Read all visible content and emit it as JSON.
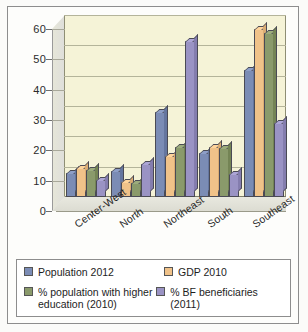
{
  "chart_data": {
    "type": "bar",
    "title": "",
    "xlabel": "",
    "ylabel": "",
    "ylim": [
      0,
      60
    ],
    "yticks": [
      "0",
      "10",
      "20",
      "30",
      "40",
      "50",
      "60"
    ],
    "grid": true,
    "legend_position": "bottom",
    "categories": [
      "Center-West",
      "North",
      "Northeast",
      "South",
      "Southeast"
    ],
    "series": [
      {
        "name": "Population 2012",
        "color": "#7b8cb5",
        "values": [
          8,
          8.5,
          28,
          14.5,
          42
        ]
      },
      {
        "name": "GDP 2010",
        "color": "#f0c289",
        "values": [
          9.5,
          5,
          13.5,
          16.5,
          55.5
        ]
      },
      {
        "name": "% population with higher education (2010)",
        "color": "#8a9a6b",
        "values": [
          9,
          4.5,
          16.5,
          16,
          54
        ]
      },
      {
        "name": "% BF beneficiaries (2011)",
        "color": "#9a93c4",
        "values": [
          5.5,
          11,
          51.5,
          7.5,
          24.5
        ]
      }
    ]
  },
  "legend": {
    "items": [
      {
        "label": "Population 2012",
        "color": "#7b8cb5"
      },
      {
        "label": "GDP 2010",
        "color": "#f0c289"
      },
      {
        "label": "% population with higher education (2010)",
        "color": "#8a9a6b"
      },
      {
        "label": "% BF beneficiaries (2011)",
        "color": "#9a93c4"
      }
    ]
  },
  "colors": {
    "plot_background": "#f5f3d7",
    "frame": "#8d8d8d",
    "grid": "#b4b49a",
    "page": "#fbfbf9"
  }
}
